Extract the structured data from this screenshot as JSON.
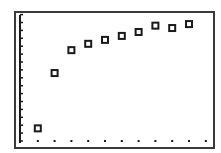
{
  "chart_data": {
    "type": "scatter",
    "title": "",
    "xlabel": "",
    "ylabel": "",
    "x": [
      1,
      2,
      3,
      4,
      5,
      6,
      7,
      8,
      9,
      10
    ],
    "series": [
      {
        "name": "data",
        "marker": "hollow-square",
        "values": [
          1.6,
          8.6,
          11.5,
          12.3,
          12.8,
          13.3,
          13.8,
          14.6,
          14.3,
          14.8
        ]
      }
    ],
    "xlim": [
      0,
      11
    ],
    "ylim": [
      0,
      16
    ],
    "x_tick_marks": [
      1,
      2,
      3,
      4,
      5,
      6,
      7,
      8,
      9,
      10,
      11
    ],
    "y_tick_count": 16,
    "grid": false,
    "legend": "none",
    "style": "graphing-calculator"
  },
  "colors": {
    "border": "#3a3a3a",
    "axis": "#1a1a1a",
    "marker": "#1a1a1a",
    "background": "#ffffff"
  }
}
